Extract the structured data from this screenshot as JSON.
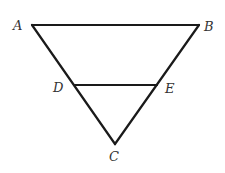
{
  "diagram": {
    "type": "geometry",
    "points": {
      "A": {
        "label": "A",
        "x": 32,
        "y": 25,
        "lx": 13,
        "ly": 30
      },
      "B": {
        "label": "B",
        "x": 199,
        "y": 25,
        "lx": 204,
        "ly": 31
      },
      "C": {
        "label": "C",
        "x": 115,
        "y": 144,
        "lx": 109,
        "ly": 161
      },
      "D": {
        "label": "D",
        "x": 75,
        "y": 85,
        "lx": 53,
        "ly": 92
      },
      "E": {
        "label": "E",
        "x": 157,
        "y": 85,
        "lx": 165,
        "ly": 93
      }
    },
    "segments": [
      {
        "name": "AB",
        "from": "A",
        "to": "B"
      },
      {
        "name": "AC",
        "from": "A",
        "to": "C"
      },
      {
        "name": "BC",
        "from": "B",
        "to": "C"
      },
      {
        "name": "DE",
        "from": "D",
        "to": "E"
      }
    ]
  }
}
